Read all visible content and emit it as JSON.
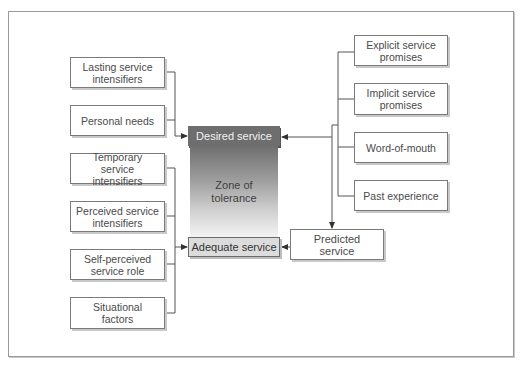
{
  "diagram": {
    "left_factors": [
      {
        "id": "lasting",
        "label": "Lasting service intensifiers",
        "line1": "Lasting service",
        "line2": "intensifiers",
        "target": "desired"
      },
      {
        "id": "personal",
        "label": "Personal needs",
        "line1": "Personal needs",
        "line2": "",
        "target": "desired"
      },
      {
        "id": "temporary",
        "label": "Temporary service intensifiers",
        "line1": "Temporary service",
        "line2": "intensifiers",
        "target": "adequate"
      },
      {
        "id": "perceived",
        "label": "Perceived service intensifiers",
        "line1": "Perceived service",
        "line2": "intensifiers",
        "target": "adequate"
      },
      {
        "id": "selfperceived",
        "label": "Self-perceived service role",
        "line1": "Self-perceived",
        "line2": "service role",
        "target": "adequate"
      },
      {
        "id": "situational",
        "label": "Situational factors",
        "line1": "Situational",
        "line2": "factors",
        "target": "adequate"
      }
    ],
    "right_factors": [
      {
        "id": "explicit",
        "line1": "Explicit service",
        "line2": "promises"
      },
      {
        "id": "implicit",
        "line1": "Implicit service",
        "line2": "promises"
      },
      {
        "id": "wom",
        "line1": "Word-of-mouth",
        "line2": ""
      },
      {
        "id": "past",
        "line1": "Past experience",
        "line2": ""
      }
    ],
    "desired_service": "Desired service",
    "zone": {
      "line1": "Zone of",
      "line2": "tolerance"
    },
    "adequate_service": "Adequate service",
    "predicted": {
      "line1": "Predicted",
      "line2": "service"
    }
  }
}
